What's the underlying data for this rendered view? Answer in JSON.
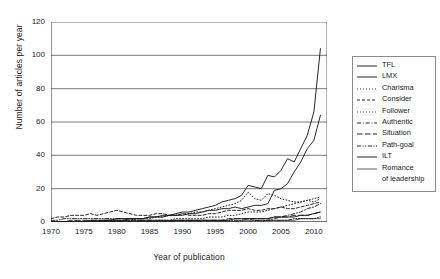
{
  "chart_data": {
    "type": "line",
    "title": "",
    "xlabel": "Year of publication",
    "ylabel": "Number of articles per year",
    "xlim": [
      1970,
      2012
    ],
    "ylim": [
      0,
      120
    ],
    "xticks": [
      "1970",
      "1975",
      "1980",
      "1985",
      "1990",
      "1995",
      "2000",
      "2005",
      "2010"
    ],
    "xtick_values": [
      1970,
      1975,
      1980,
      1985,
      1990,
      1995,
      2000,
      2005,
      2010
    ],
    "yticks": [
      "0",
      "20",
      "40",
      "60",
      "80",
      "100",
      "120"
    ],
    "ytick_values": [
      0,
      20,
      40,
      60,
      80,
      100,
      120
    ],
    "grid": "horizontal",
    "legend_position": "right",
    "x": [
      1970,
      1971,
      1972,
      1973,
      1974,
      1975,
      1976,
      1977,
      1978,
      1979,
      1980,
      1981,
      1982,
      1983,
      1984,
      1985,
      1986,
      1987,
      1988,
      1989,
      1990,
      1991,
      1992,
      1993,
      1994,
      1995,
      1996,
      1997,
      1998,
      1999,
      2000,
      2001,
      2002,
      2003,
      2004,
      2005,
      2006,
      2007,
      2008,
      2009,
      2010,
      2011
    ],
    "series": [
      {
        "name": "TFL",
        "style": "solid",
        "values": [
          0,
          0,
          0,
          0,
          0,
          0,
          0,
          0,
          1,
          1,
          1,
          1,
          2,
          2,
          2,
          3,
          3,
          4,
          4,
          5,
          6,
          6,
          7,
          8,
          9,
          10,
          12,
          13,
          14,
          16,
          22,
          21,
          20,
          28,
          27,
          31,
          38,
          36,
          44,
          52,
          66,
          104
        ]
      },
      {
        "name": "LMX",
        "style": "solid",
        "values": [
          0,
          0,
          0,
          0,
          0,
          0,
          1,
          1,
          1,
          1,
          2,
          2,
          2,
          2,
          2,
          3,
          3,
          3,
          4,
          4,
          4,
          5,
          5,
          6,
          7,
          7,
          8,
          8,
          9,
          8,
          9,
          10,
          10,
          11,
          19,
          20,
          23,
          30,
          36,
          44,
          49,
          64
        ]
      },
      {
        "name": "Charisma",
        "style": "dotted",
        "values": [
          0,
          0,
          0,
          0,
          0,
          0,
          0,
          0,
          1,
          1,
          1,
          1,
          1,
          2,
          2,
          2,
          3,
          3,
          4,
          4,
          5,
          5,
          6,
          6,
          7,
          8,
          9,
          10,
          11,
          13,
          18,
          14,
          13,
          17,
          16,
          14,
          13,
          12,
          12,
          13,
          12,
          14
        ]
      },
      {
        "name": "Consider",
        "style": "dashed",
        "values": [
          2,
          3,
          3,
          4,
          4,
          4,
          5,
          4,
          5,
          6,
          7,
          6,
          5,
          4,
          4,
          4,
          5,
          5,
          4,
          4,
          5,
          4,
          4,
          4,
          5,
          5,
          6,
          7,
          7,
          7,
          8,
          7,
          7,
          8,
          8,
          9,
          8,
          8,
          9,
          10,
          11,
          12
        ]
      },
      {
        "name": "Follower",
        "style": "dotted",
        "values": [
          0,
          0,
          0,
          0,
          0,
          0,
          0,
          0,
          0,
          0,
          0,
          1,
          1,
          1,
          1,
          1,
          1,
          1,
          1,
          2,
          2,
          2,
          2,
          2,
          3,
          3,
          3,
          4,
          4,
          5,
          6,
          6,
          6,
          7,
          8,
          9,
          10,
          11,
          12,
          13,
          14,
          15
        ]
      },
      {
        "name": "Authentic",
        "style": "dashdot",
        "values": [
          0,
          0,
          0,
          0,
          0,
          0,
          0,
          0,
          0,
          0,
          0,
          0,
          0,
          0,
          0,
          0,
          0,
          0,
          0,
          0,
          0,
          0,
          0,
          0,
          0,
          0,
          0,
          0,
          0,
          0,
          0,
          0,
          0,
          1,
          2,
          3,
          4,
          5,
          6,
          8,
          9,
          11
        ]
      },
      {
        "name": "Situation",
        "style": "dashed-long",
        "values": [
          0,
          0,
          0,
          1,
          1,
          1,
          1,
          1,
          1,
          1,
          1,
          1,
          1,
          1,
          1,
          1,
          1,
          1,
          1,
          1,
          1,
          1,
          1,
          1,
          1,
          1,
          1,
          2,
          2,
          2,
          2,
          2,
          2,
          2,
          3,
          3,
          3,
          4,
          4,
          4,
          5,
          6
        ]
      },
      {
        "name": "Path-goal",
        "style": "dashdotdot",
        "values": [
          1,
          1,
          2,
          2,
          2,
          2,
          2,
          2,
          2,
          2,
          2,
          2,
          2,
          1,
          1,
          1,
          1,
          1,
          1,
          1,
          1,
          1,
          1,
          1,
          1,
          1,
          1,
          1,
          1,
          1,
          2,
          1,
          1,
          1,
          1,
          1,
          1,
          2,
          2,
          2,
          2,
          3
        ]
      },
      {
        "name": "ILT",
        "style": "solid",
        "values": [
          0,
          0,
          0,
          0,
          0,
          0,
          0,
          0,
          0,
          0,
          0,
          0,
          0,
          0,
          0,
          0,
          0,
          0,
          0,
          1,
          1,
          1,
          1,
          1,
          1,
          1,
          1,
          1,
          2,
          2,
          2,
          2,
          2,
          2,
          3,
          3,
          3,
          3,
          4,
          4,
          5,
          6
        ]
      },
      {
        "name": "Romance of leadership",
        "style": "solid-thin",
        "values": [
          0,
          0,
          0,
          0,
          0,
          0,
          0,
          0,
          0,
          0,
          0,
          0,
          0,
          0,
          0,
          0,
          0,
          0,
          0,
          0,
          0,
          0,
          0,
          0,
          0,
          0,
          0,
          0,
          0,
          1,
          1,
          1,
          1,
          1,
          1,
          1,
          1,
          1,
          2,
          2,
          2,
          2
        ]
      }
    ]
  },
  "legend": {
    "items": [
      {
        "label": "TFL"
      },
      {
        "label": "LMX"
      },
      {
        "label": "Charisma"
      },
      {
        "label": "Consider"
      },
      {
        "label": "Follower"
      },
      {
        "label": "Authentic"
      },
      {
        "label": "Situation"
      },
      {
        "label": "Path-goal"
      },
      {
        "label": "ILT"
      },
      {
        "label": "Romance"
      },
      {
        "label": "of leadership"
      }
    ]
  },
  "colors": {
    "line": "#1a1a1a",
    "grid": "#555555",
    "axis": "#333333",
    "background": "#ffffff"
  }
}
